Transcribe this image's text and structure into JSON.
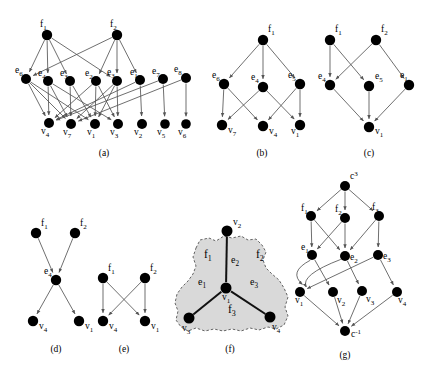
{
  "figure": {
    "width": 427,
    "height": 374,
    "background": "#ffffff",
    "node_color": "#000000",
    "edge_color": "#555555",
    "edge_color_dark": "#111111",
    "hyperface_fill": "#d9d9d9",
    "hyperface_stroke": "#555555"
  },
  "captions": {
    "a": "(a)",
    "b": "(b)",
    "c": "(c)",
    "d": "(d)",
    "e": "(e)",
    "f": "(f)",
    "g": "(g)"
  },
  "panels": {
    "a": {
      "caption": "(a)",
      "nodes": [
        {
          "id": "f1",
          "base": "f",
          "sub": "1",
          "x": 47,
          "y": 35,
          "lx": 40,
          "ly": 27,
          "r": 5.2
        },
        {
          "id": "f2",
          "base": "f",
          "sub": "2",
          "x": 117,
          "y": 35,
          "lx": 110,
          "ly": 27,
          "r": 5.2
        },
        {
          "id": "e6",
          "base": "e",
          "sub": "6",
          "x": 26,
          "y": 79,
          "lx": 15,
          "ly": 73,
          "r": 5.0
        },
        {
          "id": "e4",
          "base": "e",
          "sub": "4",
          "x": 48,
          "y": 81,
          "lx": 38,
          "ly": 76,
          "r": 5.0
        },
        {
          "id": "e3",
          "base": "e",
          "sub": "3",
          "x": 70,
          "y": 81,
          "lx": 60,
          "ly": 76,
          "r": 5.0
        },
        {
          "id": "e2",
          "base": "e",
          "sub": "2",
          "x": 96,
          "y": 81,
          "lx": 85,
          "ly": 76,
          "r": 5.0
        },
        {
          "id": "e3b",
          "base": "e",
          "sub": "3",
          "x": 117,
          "y": 81,
          "lx": 107,
          "ly": 75,
          "r": 5.0
        },
        {
          "id": "e1",
          "base": "e",
          "sub": "1",
          "x": 140,
          "y": 80,
          "lx": 130,
          "ly": 75,
          "r": 5.0
        },
        {
          "id": "e7",
          "base": "e",
          "sub": "7",
          "x": 163,
          "y": 79,
          "lx": 152,
          "ly": 74,
          "r": 5.0
        },
        {
          "id": "e8",
          "base": "e",
          "sub": "8",
          "x": 186,
          "y": 78,
          "lx": 174,
          "ly": 72,
          "r": 5.0
        },
        {
          "id": "v4",
          "base": "v",
          "sub": "4",
          "x": 49,
          "y": 123,
          "lx": 41,
          "ly": 134,
          "r": 5.0
        },
        {
          "id": "v7",
          "base": "v",
          "sub": "7",
          "x": 71,
          "y": 124,
          "lx": 63,
          "ly": 135,
          "r": 5.0
        },
        {
          "id": "v1",
          "base": "v",
          "sub": "1",
          "x": 95,
          "y": 124,
          "lx": 87,
          "ly": 135,
          "r": 5.0
        },
        {
          "id": "v3",
          "base": "v",
          "sub": "3",
          "x": 118,
          "y": 124,
          "lx": 110,
          "ly": 135,
          "r": 5.0
        },
        {
          "id": "v2",
          "base": "v",
          "sub": "2",
          "x": 142,
          "y": 124,
          "lx": 134,
          "ly": 135,
          "r": 5.0
        },
        {
          "id": "v5",
          "base": "v",
          "sub": "5",
          "x": 165,
          "y": 124,
          "lx": 157,
          "ly": 135,
          "r": 4.8
        },
        {
          "id": "v6",
          "base": "v",
          "sub": "6",
          "x": 186,
          "y": 124,
          "lx": 178,
          "ly": 135,
          "r": 4.8
        }
      ],
      "edges": [
        [
          "f1",
          "e6"
        ],
        [
          "f1",
          "e4"
        ],
        [
          "f1",
          "e3"
        ],
        [
          "f1",
          "e3b"
        ],
        [
          "f2",
          "e2"
        ],
        [
          "f2",
          "e3b"
        ],
        [
          "f2",
          "e1"
        ],
        [
          "f2",
          "e6"
        ],
        [
          "e6",
          "v4"
        ],
        [
          "e6",
          "v7"
        ],
        [
          "e6",
          "v1"
        ],
        [
          "e4",
          "v4"
        ],
        [
          "e4",
          "v7"
        ],
        [
          "e4",
          "v3"
        ],
        [
          "e3",
          "v7"
        ],
        [
          "e3",
          "v1"
        ],
        [
          "e2",
          "v4"
        ],
        [
          "e2",
          "v1"
        ],
        [
          "e2",
          "v3"
        ],
        [
          "e3b",
          "v7"
        ],
        [
          "e3b",
          "v3"
        ],
        [
          "e3b",
          "v1"
        ],
        [
          "e1",
          "v4"
        ],
        [
          "e1",
          "v2"
        ],
        [
          "e7",
          "v5"
        ],
        [
          "e7",
          "v4"
        ],
        [
          "e8",
          "v6"
        ],
        [
          "e8",
          "v7"
        ]
      ]
    },
    "b": {
      "caption": "(b)",
      "nodes": [
        {
          "id": "f1",
          "base": "f",
          "sub": "1",
          "x": 263,
          "y": 40,
          "lx": 268,
          "ly": 32,
          "r": 5.2
        },
        {
          "id": "e6",
          "base": "e",
          "sub": "6",
          "x": 224,
          "y": 84,
          "lx": 212,
          "ly": 78,
          "r": 5.2
        },
        {
          "id": "e4",
          "base": "e",
          "sub": "4",
          "x": 263,
          "y": 87,
          "lx": 251,
          "ly": 80,
          "r": 5.2
        },
        {
          "id": "e5",
          "base": "e",
          "sub": "5",
          "x": 300,
          "y": 84,
          "lx": 288,
          "ly": 78,
          "r": 5.2
        },
        {
          "id": "v7",
          "base": "v",
          "sub": "7",
          "x": 222,
          "y": 125,
          "lx": 228,
          "ly": 133,
          "r": 5.2
        },
        {
          "id": "v4",
          "base": "v",
          "sub": "4",
          "x": 263,
          "y": 126,
          "lx": 269,
          "ly": 134,
          "r": 5.2
        },
        {
          "id": "v1",
          "base": "v",
          "sub": "1",
          "x": 300,
          "y": 125,
          "lx": 291,
          "ly": 134,
          "r": 5.2
        }
      ],
      "edges": [
        [
          "f1",
          "e6"
        ],
        [
          "f1",
          "e4"
        ],
        [
          "f1",
          "e5"
        ],
        [
          "e6",
          "v7"
        ],
        [
          "e6",
          "v4"
        ],
        [
          "e4",
          "v7"
        ],
        [
          "e4",
          "v1"
        ],
        [
          "e5",
          "v4"
        ],
        [
          "e5",
          "v1"
        ]
      ]
    },
    "c": {
      "caption": "(c)",
      "nodes": [
        {
          "id": "f1",
          "base": "f",
          "sub": "1",
          "x": 330,
          "y": 40,
          "lx": 335,
          "ly": 32,
          "r": 5.2
        },
        {
          "id": "f2",
          "base": "f",
          "sub": "2",
          "x": 376,
          "y": 40,
          "lx": 381,
          "ly": 32,
          "r": 5.2
        },
        {
          "id": "e4",
          "base": "e",
          "sub": "4",
          "x": 330,
          "y": 85,
          "lx": 318,
          "ly": 79,
          "r": 5.2
        },
        {
          "id": "e5",
          "base": "e",
          "sub": "5",
          "x": 369,
          "y": 86,
          "lx": 375,
          "ly": 79,
          "r": 5.2
        },
        {
          "id": "e1",
          "base": "e",
          "sub": "1",
          "x": 409,
          "y": 85,
          "lx": 400,
          "ly": 78,
          "r": 5.2
        },
        {
          "id": "v1",
          "base": "v",
          "sub": "1",
          "x": 369,
          "y": 127,
          "lx": 375,
          "ly": 134,
          "r": 5.2
        }
      ],
      "edges": [
        [
          "f1",
          "e4"
        ],
        [
          "f1",
          "e5"
        ],
        [
          "f2",
          "e4"
        ],
        [
          "f2",
          "e1"
        ],
        [
          "e4",
          "v1"
        ],
        [
          "e5",
          "v1"
        ],
        [
          "e1",
          "v1"
        ]
      ]
    },
    "d": {
      "caption": "(d)",
      "nodes": [
        {
          "id": "f1",
          "base": "f",
          "sub": "1",
          "x": 36,
          "y": 233,
          "lx": 41,
          "ly": 226,
          "r": 5.2
        },
        {
          "id": "f2",
          "base": "f",
          "sub": "2",
          "x": 75,
          "y": 233,
          "lx": 80,
          "ly": 226,
          "r": 5.2
        },
        {
          "id": "e4",
          "base": "e",
          "sub": "4",
          "x": 56,
          "y": 280,
          "lx": 44,
          "ly": 274,
          "r": 5.2
        },
        {
          "id": "v4",
          "base": "v",
          "sub": "4",
          "x": 33,
          "y": 321,
          "lx": 39,
          "ly": 329,
          "r": 5.2
        },
        {
          "id": "v1",
          "base": "v",
          "sub": "1",
          "x": 79,
          "y": 321,
          "lx": 85,
          "ly": 329,
          "r": 5.2
        }
      ],
      "edges": [
        [
          "f1",
          "e4"
        ],
        [
          "f2",
          "e4"
        ],
        [
          "e4",
          "v4"
        ],
        [
          "e4",
          "v1"
        ]
      ]
    },
    "e": {
      "caption": "(e)",
      "nodes": [
        {
          "id": "f1",
          "base": "f",
          "sub": "1",
          "x": 103,
          "y": 278,
          "lx": 108,
          "ly": 271,
          "r": 5.2
        },
        {
          "id": "f2",
          "base": "f",
          "sub": "2",
          "x": 145,
          "y": 278,
          "lx": 150,
          "ly": 271,
          "r": 5.2
        },
        {
          "id": "v4",
          "base": "v",
          "sub": "4",
          "x": 103,
          "y": 321,
          "lx": 109,
          "ly": 329,
          "r": 5.2
        },
        {
          "id": "v1",
          "base": "v",
          "sub": "1",
          "x": 145,
          "y": 321,
          "lx": 151,
          "ly": 329,
          "r": 5.2
        }
      ],
      "edges": [
        [
          "f1",
          "v4"
        ],
        [
          "f1",
          "v1"
        ],
        [
          "f2",
          "v4"
        ],
        [
          "f2",
          "v1"
        ]
      ]
    },
    "f": {
      "caption": "(f)",
      "nodes": [
        {
          "id": "v2",
          "base": "v",
          "sub": "2",
          "x": 227,
          "y": 231,
          "lx": 233,
          "ly": 225,
          "r": 5.5
        },
        {
          "id": "v1",
          "base": "v",
          "sub": "1",
          "x": 226,
          "y": 288,
          "lx": 222,
          "ly": 300,
          "r": 5.5
        },
        {
          "id": "v3",
          "base": "v",
          "sub": "3",
          "x": 189,
          "y": 318,
          "lx": 182,
          "ly": 331,
          "r": 5.5
        },
        {
          "id": "v4",
          "base": "v",
          "sub": "4",
          "x": 270,
          "y": 317,
          "lx": 272,
          "ly": 330,
          "r": 5.5
        }
      ],
      "edges": [
        [
          "v1",
          "v2"
        ],
        [
          "v1",
          "v3"
        ],
        [
          "v1",
          "v4"
        ]
      ],
      "edge_labels": [
        {
          "text": "e",
          "sub": "1",
          "x": 198,
          "y": 285
        },
        {
          "text": "e",
          "sub": "2",
          "x": 231,
          "y": 263
        },
        {
          "text": "e",
          "sub": "3",
          "x": 250,
          "y": 285
        }
      ],
      "face_labels": [
        {
          "text": "f",
          "sub": "1",
          "x": 204,
          "y": 258
        },
        {
          "text": "f",
          "sub": "2",
          "x": 256,
          "y": 258
        },
        {
          "text": "f",
          "sub": "3",
          "x": 228,
          "y": 313
        }
      ],
      "region_path": "M 196 248 L 200 240 L 209 238 L 216 241 L 224 236 L 232 238 L 241 236 L 248 240 L 256 239 L 262 245 L 266 252 L 263 260 L 266 268 L 272 274 L 279 280 L 284 288 L 288 297 L 285 307 L 288 316 L 284 325 L 276 329 L 268 327 L 259 330 L 250 328 L 241 331 L 232 329 L 223 331 L 214 329 L 205 331 L 196 328 L 188 331 L 181 327 L 176 320 L 178 311 L 175 303 L 177 294 L 182 287 L 188 281 L 193 274 L 196 266 L 193 257 Z"
    },
    "g": {
      "caption": "(g)",
      "nodes": [
        {
          "id": "ctop",
          "base": "c",
          "sup": "3",
          "x": 345,
          "y": 186,
          "lx": 350,
          "ly": 179,
          "r": 5.0
        },
        {
          "id": "f1",
          "base": "f",
          "sub": "1",
          "x": 311,
          "y": 216,
          "lx": 301,
          "ly": 211,
          "r": 5.0
        },
        {
          "id": "f2",
          "base": "f",
          "sub": "2",
          "x": 345,
          "y": 218,
          "lx": 335,
          "ly": 212,
          "r": 5.0
        },
        {
          "id": "f3",
          "base": "f",
          "sub": "3",
          "x": 379,
          "y": 216,
          "lx": 372,
          "ly": 210,
          "r": 5.0
        },
        {
          "id": "e1",
          "base": "e",
          "sub": "1",
          "x": 312,
          "y": 255,
          "lx": 301,
          "ly": 250,
          "r": 5.0
        },
        {
          "id": "e2",
          "base": "e",
          "sub": "2",
          "x": 345,
          "y": 256,
          "lx": 350,
          "ly": 260,
          "r": 5.0
        },
        {
          "id": "e3",
          "base": "e",
          "sub": "3",
          "x": 378,
          "y": 255,
          "lx": 383,
          "ly": 259,
          "r": 5.0
        },
        {
          "id": "v1",
          "base": "v",
          "sub": "1",
          "x": 300,
          "y": 292,
          "lx": 295,
          "ly": 303,
          "r": 5.0
        },
        {
          "id": "v2",
          "base": "v",
          "sub": "2",
          "x": 333,
          "y": 292,
          "lx": 337,
          "ly": 303,
          "r": 5.0
        },
        {
          "id": "v3",
          "base": "v",
          "sub": "3",
          "x": 362,
          "y": 291,
          "lx": 366,
          "ly": 302,
          "r": 5.0
        },
        {
          "id": "v4",
          "base": "v",
          "sub": "4",
          "x": 397,
          "y": 292,
          "lx": 398,
          "ly": 303,
          "r": 5.0
        },
        {
          "id": "cbot",
          "base": "c",
          "sup": "-1",
          "x": 345,
          "y": 331,
          "lx": 351,
          "ly": 337,
          "r": 5.0
        }
      ],
      "edges": [
        [
          "ctop",
          "f1"
        ],
        [
          "ctop",
          "f2"
        ],
        [
          "ctop",
          "f3"
        ],
        [
          "f1",
          "e1"
        ],
        [
          "f1",
          "e2"
        ],
        [
          "f2",
          "e2"
        ],
        [
          "f2",
          "e1"
        ],
        [
          "f3",
          "e3"
        ],
        [
          "f3",
          "e2"
        ],
        [
          "e1",
          "v1"
        ],
        [
          "e1",
          "v2"
        ],
        [
          "e2",
          "v1"
        ],
        [
          "e2",
          "v3"
        ],
        [
          "e3",
          "v1"
        ],
        [
          "e3",
          "v4"
        ],
        [
          "v1",
          "cbot"
        ],
        [
          "v2",
          "cbot"
        ],
        [
          "v3",
          "cbot"
        ],
        [
          "v4",
          "cbot"
        ]
      ],
      "curved_edges": [
        {
          "from": "e1",
          "to": "v1",
          "cx": 288,
          "cy": 272
        },
        {
          "from": "e2",
          "to": "v1",
          "cx": 300,
          "cy": 275
        }
      ]
    }
  }
}
